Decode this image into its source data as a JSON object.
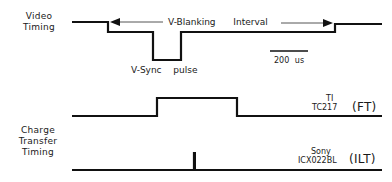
{
  "diagram": {
    "type": "timing-diagram",
    "rows": {
      "video": {
        "label_line1": "Video",
        "label_line2": "Timing",
        "interval_label_left": "V-Blanking",
        "interval_label_right": "Interval",
        "pulse_label_left": "V-Sync",
        "pulse_label_right": "pulse"
      },
      "charge_transfer": {
        "label_line1": "Charge",
        "label_line2": "Transfer",
        "label_line3": "Timing"
      },
      "ft": {
        "vendor": "TI",
        "part": "TC217",
        "type_label": "(FT)"
      },
      "ilt": {
        "vendor": "Sony",
        "part": "ICX022BL",
        "type_label": "(ILT)"
      }
    },
    "scale_bar": {
      "label": "200 us"
    },
    "colors": {
      "line": "#111111",
      "arrow": "#555555",
      "background": "#ffffff"
    }
  }
}
